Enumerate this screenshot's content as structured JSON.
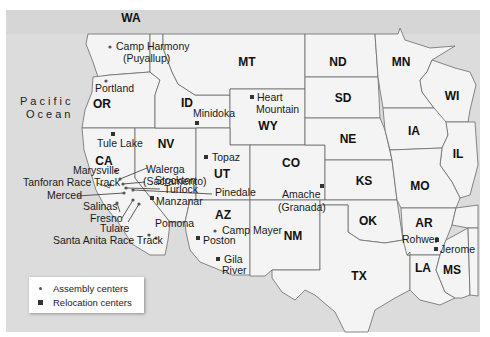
{
  "ocean_label": [
    "Pacific",
    "Ocean"
  ],
  "states": [
    {
      "abbr": "WA",
      "x": 131,
      "y": 22
    },
    {
      "abbr": "OR",
      "x": 102,
      "y": 108
    },
    {
      "abbr": "CA",
      "x": 104,
      "y": 165
    },
    {
      "abbr": "NV",
      "x": 166,
      "y": 148
    },
    {
      "abbr": "ID",
      "x": 187,
      "y": 107
    },
    {
      "abbr": "MT",
      "x": 247,
      "y": 66
    },
    {
      "abbr": "WY",
      "x": 268,
      "y": 130
    },
    {
      "abbr": "UT",
      "x": 222,
      "y": 178
    },
    {
      "abbr": "AZ",
      "x": 223,
      "y": 219
    },
    {
      "abbr": "CO",
      "x": 291,
      "y": 167
    },
    {
      "abbr": "NM",
      "x": 293,
      "y": 240
    },
    {
      "abbr": "ND",
      "x": 338,
      "y": 66
    },
    {
      "abbr": "SD",
      "x": 343,
      "y": 102
    },
    {
      "abbr": "NE",
      "x": 348,
      "y": 143
    },
    {
      "abbr": "KS",
      "x": 364,
      "y": 185
    },
    {
      "abbr": "OK",
      "x": 368,
      "y": 225
    },
    {
      "abbr": "TX",
      "x": 359,
      "y": 280
    },
    {
      "abbr": "MN",
      "x": 401,
      "y": 66
    },
    {
      "abbr": "IA",
      "x": 414,
      "y": 135
    },
    {
      "abbr": "MO",
      "x": 420,
      "y": 190
    },
    {
      "abbr": "AR",
      "x": 424,
      "y": 227
    },
    {
      "abbr": "LA",
      "x": 423,
      "y": 272
    },
    {
      "abbr": "MS",
      "x": 452,
      "y": 274
    },
    {
      "abbr": "WI",
      "x": 452,
      "y": 100
    },
    {
      "abbr": "IL",
      "x": 458,
      "y": 158
    }
  ],
  "assembly_centers": [
    {
      "name": "Camp Harmony (Puyallup)",
      "lines": [
        "Camp Harmony",
        "(Puyallup)"
      ],
      "dot": [
        110,
        47
      ]
    },
    {
      "name": "Portland",
      "lines": [
        "Portland"
      ],
      "dot": [
        106,
        81
      ]
    },
    {
      "name": "Marysville",
      "lines": [
        "Marysville"
      ],
      "dot": [
        116,
        171
      ]
    },
    {
      "name": "Walerga (Sacramento)",
      "lines": [
        "Walerga",
        "(Sacramento)"
      ],
      "dot": [
        120,
        179
      ]
    },
    {
      "name": "Tanforan Race Track",
      "lines": [
        "Tanforan Race Track"
      ],
      "dot": [
        110,
        185
      ]
    },
    {
      "name": "Stockton",
      "lines": [
        "Stockton"
      ],
      "dot": [
        123,
        184
      ]
    },
    {
      "name": "Turlock",
      "lines": [
        "Turlock"
      ],
      "dot": [
        126,
        188
      ]
    },
    {
      "name": "Merced",
      "lines": [
        "Merced"
      ],
      "dot": [
        124,
        193
      ]
    },
    {
      "name": "Salinas",
      "lines": [
        "Salinas"
      ],
      "dot": [
        117,
        203
      ]
    },
    {
      "name": "Fresno",
      "lines": [
        "Fresno"
      ],
      "dot": [
        133,
        200
      ]
    },
    {
      "name": "Tulare",
      "lines": [
        "Tulare"
      ],
      "dot": [
        139,
        204
      ]
    },
    {
      "name": "Pomona",
      "lines": [
        "Pomona"
      ],
      "dot": [
        156,
        238
      ]
    },
    {
      "name": "Santa Anita Race Track",
      "lines": [
        "Santa Anita Race Track"
      ],
      "dot": [
        149,
        235
      ]
    },
    {
      "name": "Pinedale",
      "lines": [
        "Pinedale"
      ],
      "dot": [
        133,
        190
      ]
    },
    {
      "name": "Camp Mayer",
      "lines": [
        "Camp Mayer"
      ],
      "dot": [
        215,
        231
      ]
    }
  ],
  "relocation_centers": [
    {
      "name": "Tule Lake",
      "lines": [
        "Tule Lake"
      ],
      "sq": [
        113,
        134
      ]
    },
    {
      "name": "Minidoka",
      "lines": [
        "Minidoka"
      ],
      "sq": [
        197,
        123
      ]
    },
    {
      "name": "Heart Mountain",
      "lines": [
        "Heart",
        "Mountain"
      ],
      "sq": [
        252,
        97
      ]
    },
    {
      "name": "Topaz",
      "lines": [
        "Topaz"
      ],
      "sq": [
        206,
        157
      ]
    },
    {
      "name": "Manzanar",
      "lines": [
        "Manzanar"
      ],
      "sq": [
        152,
        198
      ]
    },
    {
      "name": "Poston",
      "lines": [
        "Poston"
      ],
      "sq": [
        198,
        238
      ]
    },
    {
      "name": "Gila River",
      "lines": [
        "Gila",
        "River"
      ],
      "sq": [
        218,
        259
      ]
    },
    {
      "name": "Amache (Granada)",
      "lines": [
        "Amache",
        "(Granada)"
      ],
      "sq": [
        322,
        186
      ]
    },
    {
      "name": "Rohwer",
      "lines": [
        "Rohwer"
      ],
      "sq": [
        437,
        240
      ]
    },
    {
      "name": "Jerome",
      "lines": [
        "Jerome"
      ],
      "sq": [
        436,
        249
      ]
    }
  ],
  "legend": {
    "items": [
      {
        "symbol": "dot",
        "label": "Assembly centers"
      },
      {
        "symbol": "square",
        "label": "Relocation centers"
      }
    ]
  },
  "colors": {
    "ocean": "#dcdcdc",
    "land": "#f4f4f4",
    "border": "#6a6a6a",
    "marker": "#333333"
  }
}
